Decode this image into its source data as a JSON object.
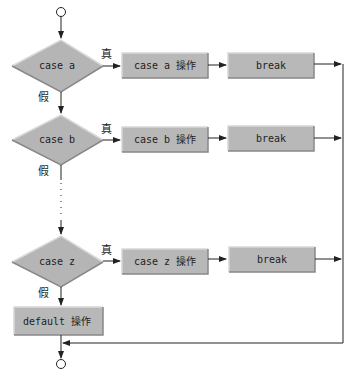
{
  "colors": {
    "shape_fill": "#b8b8b8",
    "shape_light": "#d6d6d6",
    "shape_dark": "#8a8a8a",
    "line": "#222222"
  },
  "cases": [
    {
      "condition": "case a",
      "action": "case a 操作",
      "break": "break",
      "true_label": "真",
      "false_label": "假"
    },
    {
      "condition": "case b",
      "action": "case b 操作",
      "break": "break",
      "true_label": "真",
      "false_label": "假"
    },
    {
      "condition": "case z",
      "action": "case z 操作",
      "break": "break",
      "true_label": "真",
      "false_label": "假"
    }
  ],
  "default": {
    "action": "default 操作"
  }
}
